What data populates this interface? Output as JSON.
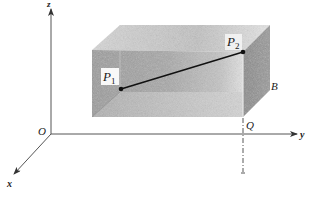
{
  "figure": {
    "type": "3d-coordinate-diagram",
    "colors": {
      "background": "#ffffff",
      "axis": "#555555",
      "segment": "#111111",
      "box_top": "#c8c8c8",
      "box_front": "#a9a9a9",
      "box_side": "#8a8a8a",
      "box_bottom_inner": "#b8b8b8"
    }
  },
  "axes": {
    "origin_label": "O",
    "x_label": "x",
    "y_label": "y",
    "z_label": "z"
  },
  "points": {
    "p1": {
      "name": "P",
      "subscript": "1"
    },
    "p2": {
      "name": "P",
      "subscript": "2"
    },
    "b": {
      "name": "B"
    },
    "q": {
      "name": "Q"
    }
  }
}
